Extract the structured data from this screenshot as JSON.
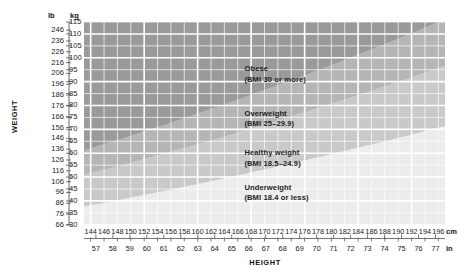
{
  "chart_data": {
    "type": "area",
    "title": "",
    "xlabel": "HEIGHT",
    "ylabel": "WEIGHT",
    "grid": true,
    "legend_position": "inline-annotations",
    "x_axes": [
      {
        "name": "cm",
        "unit_label": "cm",
        "ticks": [
          144,
          146,
          148,
          150,
          152,
          154,
          156,
          158,
          160,
          162,
          164,
          166,
          168,
          170,
          172,
          174,
          176,
          178,
          180,
          182,
          184,
          186,
          188,
          190,
          192,
          194,
          196
        ],
        "range": [
          143,
          197
        ]
      },
      {
        "name": "in",
        "unit_label": "in",
        "ticks": [
          57,
          58,
          59,
          60,
          61,
          62,
          63,
          64,
          65,
          66,
          67,
          68,
          69,
          70,
          71,
          72,
          73,
          74,
          75,
          76,
          77
        ],
        "range": [
          56.3,
          77.6
        ]
      }
    ],
    "y_axes": [
      {
        "name": "lb",
        "unit_label": "lb",
        "ticks": [
          246,
          236,
          226,
          216,
          206,
          196,
          186,
          176,
          166,
          156,
          146,
          136,
          126,
          116,
          106,
          96,
          86,
          76,
          66
        ],
        "range": [
          66,
          253.5
        ]
      },
      {
        "name": "kg",
        "unit_label": "kg",
        "ticks": [
          115,
          110,
          105,
          100,
          95,
          90,
          85,
          80,
          75,
          70,
          65,
          60,
          55,
          50,
          45,
          40,
          35,
          30
        ],
        "range": [
          29.9,
          115.0
        ]
      }
    ],
    "bands": [
      {
        "id": "obese",
        "label": "Obese",
        "sub_label": "(BMI 30 or more)",
        "bmi_min": 30,
        "bmi_max": null,
        "color": "#9a9a9a"
      },
      {
        "id": "overweight",
        "label": "Overweight",
        "sub_label": "(BMI 25–29.9)",
        "bmi_min": 25,
        "bmi_max": 29.9,
        "color": "#b5b5b5"
      },
      {
        "id": "healthy",
        "label": "Healthy weight",
        "sub_label": "(BMI 18.5–24.9)",
        "bmi_min": 18.5,
        "bmi_max": 24.9,
        "color": "#c9c9c9"
      },
      {
        "id": "underweight",
        "label": "Underweight",
        "sub_label": "(BMI 18.4 or less)",
        "bmi_min": null,
        "bmi_max": 18.4,
        "color": "#ececec"
      }
    ],
    "gridline_color": "#ffffff",
    "background": "#ffffff"
  },
  "axis_titles": {
    "weight": "WEIGHT",
    "height": "HEIGHT"
  },
  "units": {
    "lb": "lb",
    "kg": "kg",
    "cm": "cm",
    "in": "in"
  }
}
